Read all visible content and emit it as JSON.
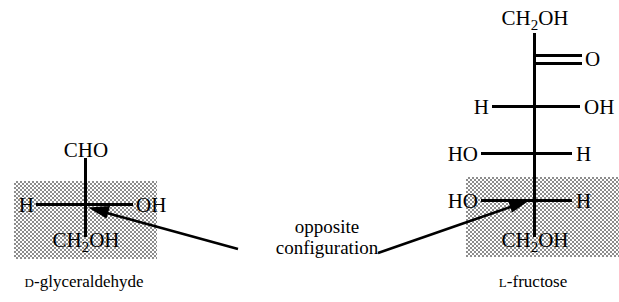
{
  "diagram": {
    "background_color": "#ffffff",
    "highlight_color": "#b8b8b8",
    "line_color": "#000000"
  },
  "annotation": {
    "line1": "opposite",
    "line2": "configuration"
  },
  "structures": [
    {
      "id": "d-glyceraldehyde",
      "caption_prefix": "D",
      "caption_suffix": "-glyceraldehyde",
      "caption_full": "D-glyceraldehyde",
      "highlighted_row_index": 1,
      "rows": [
        {
          "type": "top-group",
          "center": "CHO"
        },
        {
          "type": "stereocenter",
          "left": "H",
          "right": "OH"
        },
        {
          "type": "bottom-group",
          "center": "CH2OH"
        }
      ]
    },
    {
      "id": "l-fructose",
      "caption_prefix": "L",
      "caption_suffix": "-fructose",
      "caption_full": "L-fructose",
      "highlighted_row_index": 4,
      "rows": [
        {
          "type": "top-group",
          "center": "CH2OH"
        },
        {
          "type": "carbonyl",
          "right": "O",
          "bond": "double"
        },
        {
          "type": "stereocenter",
          "left": "H",
          "right": "OH"
        },
        {
          "type": "stereocenter",
          "left": "HO",
          "right": "H"
        },
        {
          "type": "stereocenter",
          "left": "HO",
          "right": "H"
        },
        {
          "type": "bottom-group",
          "center": "CH2OH"
        }
      ]
    }
  ],
  "arrows": [
    {
      "id": "arrow-to-glyceraldehyde",
      "points_to": "d-glyceraldehyde-stereocenter"
    },
    {
      "id": "arrow-to-fructose",
      "points_to": "l-fructose-c5-stereocenter"
    }
  ]
}
